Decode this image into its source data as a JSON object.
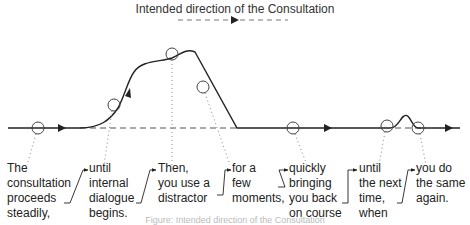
{
  "title": "Intended direction of the Consultation",
  "colors": {
    "line": "#222222",
    "dotted": "#888888",
    "dashed": "#666666",
    "text": "#222222"
  },
  "labels": [
    {
      "id": "steady",
      "lines": [
        "The",
        "consultation",
        "proceeds",
        "steadily,"
      ]
    },
    {
      "id": "internal",
      "lines": [
        "until",
        "internal",
        "dialogue",
        "begins."
      ]
    },
    {
      "id": "distractor",
      "lines": [
        "Then,",
        "you use a",
        "distractor"
      ]
    },
    {
      "id": "moments",
      "lines": [
        "for a",
        "few",
        "moments,"
      ]
    },
    {
      "id": "back",
      "lines": [
        "quickly",
        "bringing",
        "you back",
        "on course"
      ]
    },
    {
      "id": "next",
      "lines": [
        "until",
        "the next",
        "time,",
        "when"
      ]
    },
    {
      "id": "again",
      "lines": [
        "you do",
        "the same",
        "again."
      ]
    }
  ],
  "label_text": {
    "steady": "The\nconsultation\nproceeds\nsteadily,",
    "internal": "until\ninternal\ndialogue\nbegins.",
    "distractor": "Then,\nyou use a\ndistractor",
    "moments": "for a\nfew\nmoments,",
    "back": "quickly\nbringing\nyou back\non course",
    "next": "until\nthe next\ntime,\nwhen",
    "again": "you do\nthe same\nagain."
  },
  "caption": "Figure: Intended direction of the Consultation"
}
